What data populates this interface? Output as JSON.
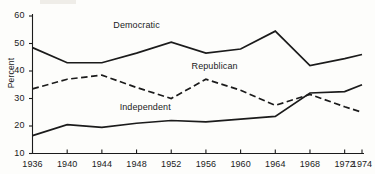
{
  "chart_data": {
    "type": "line",
    "title": "",
    "subtitle": "",
    "xlabel": "",
    "ylabel": "Percent",
    "x": [
      1936,
      1940,
      1944,
      1948,
      1952,
      1956,
      1960,
      1964,
      1968,
      1972,
      1974
    ],
    "categories": [
      "1936",
      "1940",
      "1944",
      "1948",
      "1952",
      "1956",
      "1960",
      "1964",
      "1968",
      "1972",
      "1974"
    ],
    "xlim": [
      1936,
      1974
    ],
    "ylim": [
      10,
      60
    ],
    "yticks": [
      10,
      20,
      30,
      40,
      50,
      60
    ],
    "ytick_labels": [
      "10",
      "20",
      "30",
      "40",
      "50",
      "60"
    ],
    "xticks": [
      1936,
      1940,
      1944,
      1948,
      1952,
      1956,
      1960,
      1964,
      1968,
      1972,
      1974
    ],
    "xtick_labels": [
      "1936",
      "1940",
      "1944",
      "1948",
      "1952",
      "1956",
      "1960",
      "1964",
      "1968",
      "1972",
      "1974"
    ],
    "grid": false,
    "legend": "inline-annotations",
    "series": [
      {
        "name": "Democratic",
        "style": "solid",
        "color": "#1b1b1b",
        "values": [
          48.5,
          43.0,
          43.0,
          46.5,
          50.5,
          46.5,
          48.0,
          54.5,
          42.0,
          44.5,
          46.0
        ],
        "label_x": 1948,
        "label_y": 56.5
      },
      {
        "name": "Republican",
        "style": "dashed",
        "color": "#1b1b1b",
        "values": [
          33.5,
          37.0,
          38.5,
          34.0,
          30.0,
          37.0,
          33.0,
          27.5,
          31.5,
          27.0,
          25.0
        ],
        "label_x": 1957,
        "label_y": 41.5
      },
      {
        "name": "Independent",
        "style": "solid",
        "color": "#1b1b1b",
        "values": [
          16.5,
          20.5,
          19.5,
          21.0,
          22.0,
          21.5,
          22.5,
          23.5,
          32.0,
          32.5,
          35.0
        ],
        "label_x": 1949,
        "label_y": 26.5
      }
    ]
  },
  "axes": {
    "ylabel_text": "Percent"
  }
}
